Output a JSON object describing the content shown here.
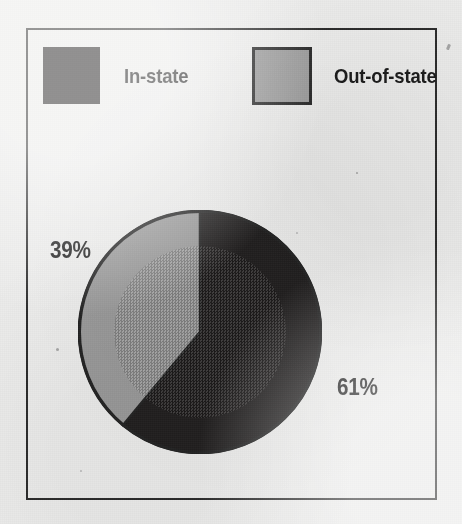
{
  "chart_data": {
    "type": "pie",
    "title": "",
    "categories": [
      "In-state",
      "Out-of-state"
    ],
    "values": [
      61,
      39
    ],
    "value_labels": [
      "61%",
      "39%"
    ],
    "units": "percent",
    "start_angle_deg": 0,
    "direction": "clockwise",
    "legend_position": "top",
    "grid": false,
    "slices": [
      {
        "label": "In-state",
        "value": 61,
        "value_label": "61%",
        "color": "#211f1f",
        "start_angle_deg": 0,
        "end_angle_deg": 219.6
      },
      {
        "label": "Out-of-state",
        "value": 39,
        "value_label": "39%",
        "color": "#9a9a9a",
        "start_angle_deg": 219.6,
        "end_angle_deg": 360
      }
    ]
  },
  "legend": {
    "items": [
      {
        "label": "In-state",
        "color": "#211f1f"
      },
      {
        "label": "Out-of-state",
        "color": "#9a9a9a"
      }
    ]
  },
  "colors": {
    "in_state": "#211f1f",
    "out_of_state": "#9a9a9a",
    "frame": "#2b2b2b",
    "background": "#ececeb",
    "text": "#1b1b1b"
  }
}
